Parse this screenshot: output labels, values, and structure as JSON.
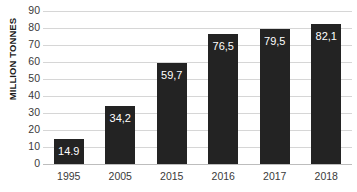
{
  "chart_data": {
    "type": "bar",
    "title": "",
    "subtitle": "",
    "xlabel": "",
    "ylabel": "MILLION TONNES",
    "categories": [
      "1995",
      "2005",
      "2015",
      "2016",
      "2017",
      "2018"
    ],
    "values": [
      14.9,
      34.2,
      59.7,
      76.5,
      79.5,
      82.1
    ],
    "data_labels": [
      "14.9",
      "34,2",
      "59,7",
      "76,5",
      "79,5",
      "82,1"
    ],
    "ylim": [
      0,
      90
    ],
    "y_ticks": [
      "0",
      "10",
      "20",
      "30",
      "40",
      "50",
      "60",
      "70",
      "80",
      "90"
    ],
    "y_tick_values": [
      0,
      10,
      20,
      30,
      40,
      50,
      60,
      70,
      80,
      90
    ],
    "grid": "horizontal",
    "legend": "none",
    "series": [
      {
        "name": "",
        "values": [
          14.9,
          34.2,
          59.7,
          76.5,
          79.5,
          82.1
        ]
      }
    ],
    "colors": {
      "bar_fill": "#232323",
      "data_label_text": "#ffffff",
      "gridline": "#d6d6d6",
      "axis_text": "#3a3a3a",
      "axis_title": "#1a1a1a",
      "background": "#ffffff"
    }
  }
}
